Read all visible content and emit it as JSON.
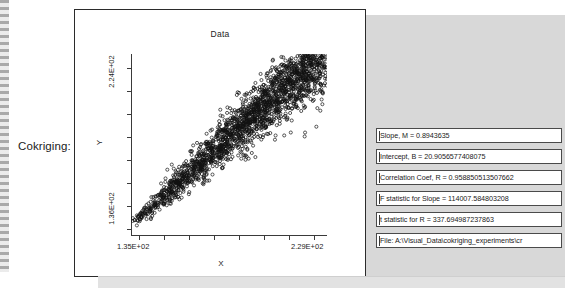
{
  "form": {
    "field_label": "Cokriging:"
  },
  "plot": {
    "title": "Data",
    "x_axis_name": "X",
    "y_axis_name": "Y",
    "x_min_label": "1.35E+02",
    "x_max_label": "2.29E+02",
    "y_min_label": "1.36E+02",
    "y_max_label": "2.24E+02"
  },
  "results": [
    {
      "name": "slope",
      "text": "Slope, M = 0.8943635"
    },
    {
      "name": "intercept",
      "text": "Intercept, B = 20.9056577408075"
    },
    {
      "name": "correlation-coefficient",
      "text": "Correlation Coef, R = 0.958850513507662"
    },
    {
      "name": "f-statistic-slope",
      "text": "F statistic for Slope = 114007.584803208"
    },
    {
      "name": "t-statistic-r",
      "text": "t statistic for R = 337.694987237863"
    },
    {
      "name": "file-path",
      "text": "File: A:\\Visual_Data\\cokriging_experiments\\cr"
    }
  ],
  "colors": {
    "panel_border": "#2b2b2b",
    "dialog_background": "#d8d8d8",
    "field_background": "#ffffff",
    "text": "#1a1a1a"
  },
  "chart_data": {
    "type": "scatter",
    "title": "Data",
    "xlabel": "X",
    "ylabel": "Y",
    "xlim": [
      135,
      229
    ],
    "ylim": [
      136,
      224
    ],
    "xtick_labels": [
      "1.35E+02",
      "2.29E+02"
    ],
    "ytick_labels": [
      "1.36E+02",
      "2.24E+02"
    ],
    "grid": false,
    "legend": null,
    "n_points": 2200,
    "marker": "open-circle",
    "fit_line": {
      "slope": 0.8943635,
      "intercept": 20.9056577408075,
      "r": 0.958850513507662
    },
    "annotations": []
  }
}
